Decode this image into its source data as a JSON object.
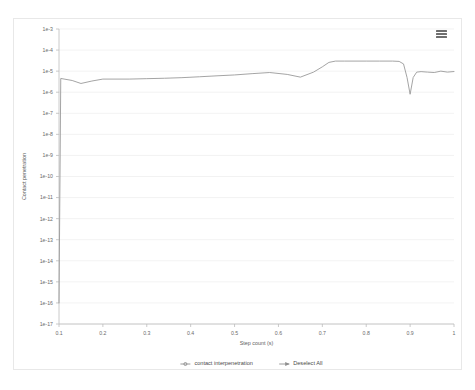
{
  "chart_data": {
    "type": "line",
    "title": "",
    "xlabel": "Step count (s)",
    "ylabel": "Contact penetration",
    "yscale": "log",
    "ylim": [
      1e-17,
      0.001
    ],
    "xlim": [
      0.1,
      1.0
    ],
    "grid": true,
    "legend_position": "bottom",
    "y_tick_labels": [
      "1e-3",
      "1e-4",
      "1e-5",
      "1e-6",
      "1e-7",
      "1e-8",
      "1e-9",
      "1e-10",
      "1e-11",
      "1e-12",
      "1e-13",
      "1e-14",
      "1e-15",
      "1e-16",
      "1e-17"
    ],
    "y_tick_values": [
      0.001,
      0.0001,
      1e-05,
      1e-06,
      1e-07,
      1e-08,
      1e-09,
      1e-10,
      1e-11,
      1e-12,
      1e-13,
      1e-14,
      1e-15,
      1e-16,
      1e-17
    ],
    "x_tick_labels": [
      "0.1",
      "0.2",
      "0.3",
      "0.4",
      "0.5",
      "0.6",
      "0.7",
      "0.8",
      "0.9",
      "1"
    ],
    "x_tick_values": [
      0.1,
      0.2,
      0.3,
      0.4,
      0.5,
      0.6,
      0.7,
      0.8,
      0.9,
      1.0
    ],
    "series": [
      {
        "name": "contact interpenetration",
        "color": "#9a9a9a",
        "x": [
          0.1,
          0.104,
          0.13,
          0.15,
          0.175,
          0.2,
          0.23,
          0.26,
          0.3,
          0.34,
          0.38,
          0.42,
          0.46,
          0.5,
          0.54,
          0.58,
          0.62,
          0.65,
          0.68,
          0.7,
          0.715,
          0.73,
          0.75,
          0.77,
          0.8,
          0.83,
          0.86,
          0.875,
          0.885,
          0.893,
          0.9,
          0.907,
          0.915,
          0.925,
          0.94,
          0.955,
          0.97,
          0.985,
          1.0
        ],
        "y": [
          1e-16,
          4.5e-06,
          3.6e-06,
          2.6e-06,
          3.4e-06,
          4.2e-06,
          4.2e-06,
          4.2e-06,
          4.4e-06,
          4.6e-06,
          4.9e-06,
          5.4e-06,
          6e-06,
          6.6e-06,
          7.6e-06,
          8.6e-06,
          7e-06,
          5.2e-06,
          9e-06,
          1.6e-05,
          2.6e-05,
          3e-05,
          3e-05,
          3e-05,
          3e-05,
          3e-05,
          3e-05,
          2.9e-05,
          2.2e-05,
          5e-06,
          8e-07,
          5e-06,
          9e-06,
          9.5e-06,
          9e-06,
          8.6e-06,
          1e-05,
          9e-06,
          9.6e-06
        ]
      }
    ],
    "legend": [
      {
        "label": "contact interpenetration",
        "marker": "circle-line"
      },
      {
        "label": "Deselect All",
        "marker": "arrow-line"
      }
    ]
  },
  "toolbar": {
    "menu_label": "Chart context menu"
  }
}
